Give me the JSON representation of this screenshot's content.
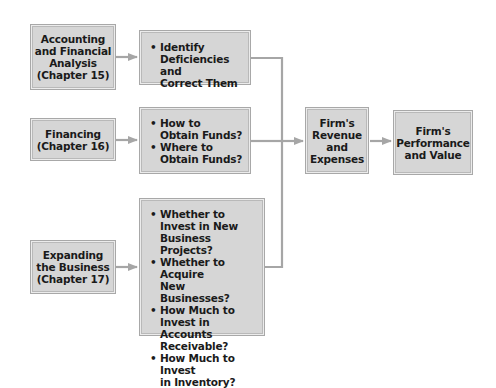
{
  "diagram": {
    "colors": {
      "box_fill": "#d6d6d6",
      "box_border": "#a8a8a8",
      "connector": "#a6a6a6",
      "text": "#1a1a1a"
    },
    "nodes": {
      "accounting": {
        "label": "Accounting\nand Financial\nAnalysis\n(Chapter 15)"
      },
      "accounting_tasks": {
        "items": [
          "Identify\nDeficiencies and\nCorrect Them"
        ]
      },
      "financing": {
        "label": "Financing\n(Chapter 16)"
      },
      "financing_tasks": {
        "items": [
          "How to\nObtain Funds?",
          "Where to\nObtain Funds?"
        ]
      },
      "expanding": {
        "label": "Expanding\nthe Business\n(Chapter 17)"
      },
      "expanding_tasks": {
        "items": [
          "Whether to\nInvest in New\nBusiness Projects?",
          "Whether to Acquire\nNew Businesses?",
          "How Much to\nInvest in Accounts\nReceivable?",
          "How Much to Invest\nin Inventory?"
        ]
      },
      "revenue": {
        "label": "Firm's\nRevenue\nand\nExpenses"
      },
      "performance": {
        "label": "Firm's\nPerformance\nand Value"
      }
    },
    "edges": [
      [
        "accounting",
        "accounting_tasks"
      ],
      [
        "financing",
        "financing_tasks"
      ],
      [
        "expanding",
        "expanding_tasks"
      ],
      [
        "accounting_tasks",
        "revenue"
      ],
      [
        "financing_tasks",
        "revenue"
      ],
      [
        "expanding_tasks",
        "revenue"
      ],
      [
        "revenue",
        "performance"
      ]
    ]
  }
}
